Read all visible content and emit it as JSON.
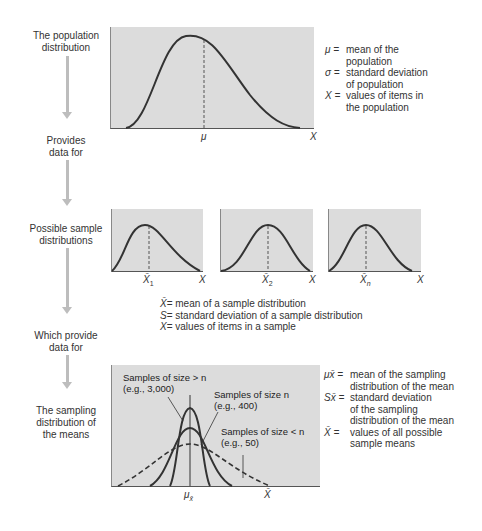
{
  "steps": [
    {
      "label_line1": "The population",
      "label_line2": "distribution"
    },
    {
      "label_line1": "Provides",
      "label_line2": "data for"
    },
    {
      "label_line1": "Possible sample",
      "label_line2": "distributions"
    },
    {
      "label_line1": "Which provide",
      "label_line2": "data for"
    },
    {
      "label_line1": "The sampling",
      "label_line2": "distribution of",
      "label_line3": "the means"
    }
  ],
  "population": {
    "mean_label": "μ",
    "axis_label": "X",
    "legend": [
      {
        "symbol": "μ =",
        "line1": "mean of the",
        "line2": "population"
      },
      {
        "symbol": "σ =",
        "line1": "standard deviation",
        "line2": "of population"
      },
      {
        "symbol": "X =",
        "line1": "values of items in",
        "line2": "the population"
      }
    ]
  },
  "samples": {
    "boxes": [
      {
        "mean_label": "X̄",
        "subscript": "1",
        "axis_label": "X"
      },
      {
        "mean_label": "X̄",
        "subscript": "2",
        "axis_label": "X"
      },
      {
        "mean_label": "X̄",
        "subscript": "n",
        "axis_label": "X"
      }
    ],
    "legend": [
      {
        "symbol": "X̄",
        "text": " = mean of a sample distribution"
      },
      {
        "symbol": "S",
        "text": " = standard deviation of a sample distribution"
      },
      {
        "symbol": "X",
        "text": " = values of items in a sample"
      }
    ]
  },
  "sampling": {
    "mean_label": "μ",
    "mean_subscript": "x̄",
    "axis_label": "X̄",
    "curves": [
      {
        "line1": "Samples of size > n",
        "line2": "(e.g., 3,000)"
      },
      {
        "line1": "Samples of size n",
        "line2": "(e.g., 400)"
      },
      {
        "line1": "Samples of size < n",
        "line2": "(e.g., 50)"
      }
    ],
    "legend": [
      {
        "symbol": "μx̄ =",
        "lines": [
          "mean of the sampling",
          "distribution of the mean"
        ]
      },
      {
        "symbol": "Sx̄ =",
        "lines": [
          "standard deviation",
          "of the sampling",
          "distribution of the mean"
        ]
      },
      {
        "symbol": "X̄  =",
        "lines": [
          "values of all possible",
          "sample means"
        ]
      }
    ]
  },
  "colors": {
    "panel": "#dcdcdc",
    "curve": "#333333",
    "arrow": "#bdbdbd"
  }
}
